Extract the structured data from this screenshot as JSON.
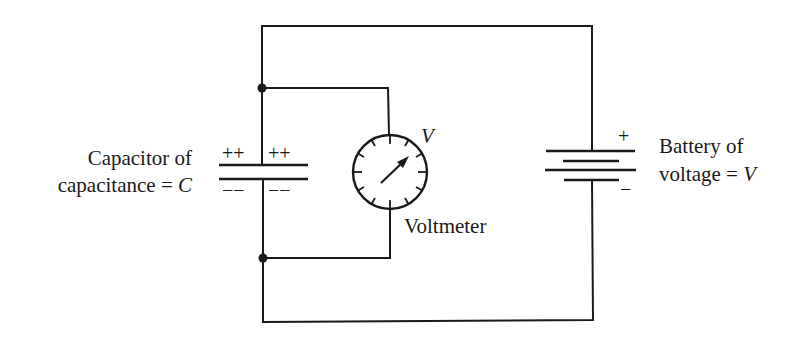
{
  "diagram": {
    "capacitor": {
      "label_line1": "Capacitor of",
      "label_line2_prefix": "capacitance = ",
      "label_line2_symbol": "C",
      "top_charges": "++ ++",
      "bottom_charges": "-- --",
      "top_plus_left": "++",
      "top_plus_right": "++",
      "bottom_minus_left": "−−",
      "bottom_minus_right": "−−"
    },
    "voltmeter": {
      "symbol": "V",
      "label": "Voltmeter"
    },
    "battery": {
      "label_line1": "Battery of",
      "label_line2_prefix": "voltage = ",
      "label_line2_symbol": "V",
      "plus_sign": "+",
      "minus_sign": "−"
    },
    "colors": {
      "ink": "#1a1a1a",
      "background": "#ffffff"
    }
  }
}
